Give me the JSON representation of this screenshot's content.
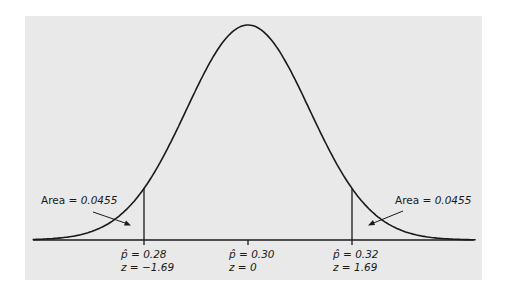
{
  "chart_data": {
    "type": "line",
    "title": "",
    "xlabel": "",
    "ylabel": "",
    "grid": false,
    "legend": null,
    "mean_p_hat": 0.3,
    "tick_marks": [
      {
        "p_hat_label": "p̂ =  0.28",
        "z_label": "z = −1.69",
        "p_hat": 0.28,
        "z": -1.69
      },
      {
        "p_hat_label": "p̂ = 0.30",
        "z_label": "z = 0",
        "p_hat": 0.3,
        "z": 0
      },
      {
        "p_hat_label": "p̂ = 0.32",
        "z_label": "z = 1.69",
        "p_hat": 0.32,
        "z": 1.69
      }
    ],
    "annotations": [
      {
        "side": "left",
        "text_prefix": "Area = ",
        "value": "0.0455"
      },
      {
        "side": "right",
        "text_prefix": "Area = ",
        "value": "0.0455"
      }
    ],
    "z_range": [
      -3.5,
      3.7
    ]
  },
  "colors": {
    "panel_bg": "#e9e9e9",
    "line": "#1a1a1a",
    "page_bg": "#ffffff"
  }
}
